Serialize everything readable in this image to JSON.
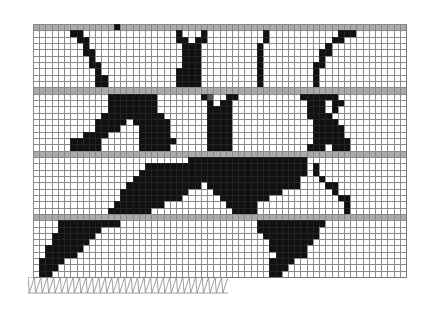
{
  "figure": {
    "title": "",
    "grid": {
      "cols": 60,
      "rows": 40
    },
    "floor_rows": [
      0,
      10,
      20,
      30
    ],
    "legend": {
      "s": "solid",
      "g": "floor slab",
      "h": "intermediate",
      ".": "void"
    },
    "rows": [
      "gggggggggggggsgggggggggggggggggggggggggggggggggggggggggggggg",
      "......ss...............s...s.........s...........sss........",
      ".......ss..............ss.ss.........s..........ss..........",
      "........s...............sss.........s..........s...........",
      "........ss..............sss.........s.........ss...........",
      ".........s..............sss.........s.........s............",
      ".........ss.............sss.........s........ss............",
      "..........s............ssss.........s........s.............",
      "..........ss...........ssss.........s........s.............",
      "..........ss...........ssss.........s........s.............",
      "gggggggggggggggggggggggggggggggggggggggggggggggggggggggggggg",
      "............ssssssss.......sh..ss..........ssssss...........",
      "............ssssssss........s.ss............sss.ss..........",
      "............ssssssss........ssss............sss.s...........",
      "...........ssssssssss.......ssss............ssss............",
      "..........sssss.ssssss......ssss.............ssss...........",
      "..........ssss...sssss......ssss.............sssss..........",
      "........ssss.....sssss......ssss.............sssss..........",
      "......sssss......ssssss.....ssss.............ssssss.........",
      "......sssss......sssss......ssss............sss.sss.........",
      "gggggggggggggggggggggggggggggggggggggggggggggggggggggggggggg",
      ".........................sssssssssssssssssss................",
      "..................ssssssssssssssssssssssssss.s..............",
      ".................sssssssssssssssssssssssssss.s..............",
      "................sssssssssssssssssssssssssss...s.............",
      "...............ssssssssssss.sssssssssssssss....ss...........",
      "..............sssssssssss....sssssssssss........s...........",
      "..............ssssssssss......ssssssss...........ss.........",
      ".............ssssssss..........sssss..............s.........",
      "............sssssss.............ssss..............s.........",
      "gggggggggggggggggggggggggggggggggggggggggggggggggggggggggggg",
      "....ssssssssss......................sssssssssss.............",
      "....sssssss.........................ssssssssss..............",
      "...sssssss...........................sssssssss..............",
      "...ssssss.............................sssssss...............",
      "..ssssss..............................ssssss................",
      "..sssss................................sssss................",
      ".ssss.................................ssss..................",
      ".sss..................................sss...................",
      ".ss...................................ss...................."
    ],
    "support": {
      "type": "fixed-hatch",
      "from_col": 0,
      "to_col": 31,
      "count": 31
    }
  }
}
